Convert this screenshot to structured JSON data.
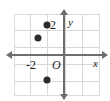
{
  "figure": {
    "background_color": "#ffffff",
    "axis_color": "#6e6e6e",
    "grid_color": "#d8d8d8",
    "point_color": "#2b2b2b"
  },
  "labels": {
    "y_axis_name": "y",
    "x_axis_name": "x",
    "origin": "O",
    "y_tick_2": "2",
    "x_tick_neg2": "-2"
  },
  "chart_data": {
    "type": "scatter",
    "title": "",
    "xlabel": "x",
    "ylabel": "y",
    "xlim": [
      -3,
      2
    ],
    "ylim": [
      -2.5,
      2.5
    ],
    "grid": true,
    "legend": "none",
    "origin_label": "O",
    "xticks": [
      -2
    ],
    "xticklabels": [
      "-2"
    ],
    "yticks": [
      2
    ],
    "yticklabels": [
      "2"
    ],
    "series": [
      {
        "name": "points",
        "marker": "filled-circle",
        "color": "#2b2b2b",
        "points": [
          {
            "x": -1,
            "y": 1.75,
            "px": 47,
            "py": 25
          },
          {
            "x": -1.5,
            "y": 1,
            "px": 38,
            "py": 38
          },
          {
            "x": -1,
            "y": -1.5,
            "px": 47,
            "py": 80
          }
        ]
      }
    ],
    "annotations": [
      {
        "text": "2",
        "x": -0.6,
        "y": 1.75
      },
      {
        "text": "-2",
        "x": -2,
        "y": -0.3
      },
      {
        "text": "O",
        "x": -0.45,
        "y": -0.3
      },
      {
        "text": "y",
        "x": 0.25,
        "y": 2.2
      },
      {
        "text": "x",
        "x": 1.7,
        "y": -0.25
      }
    ]
  }
}
